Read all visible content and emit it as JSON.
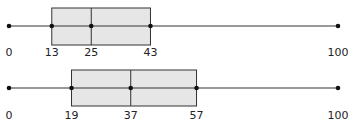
{
  "chart_data": [
    {
      "type": "boxplot",
      "title": "",
      "xlabel": "",
      "ylabel": "",
      "xlim": [
        0,
        100
      ],
      "grid": false,
      "min": 0,
      "q1": 13,
      "median": 25,
      "q3": 43,
      "max": 100,
      "tick_labels": [
        "0",
        "13",
        "25",
        "43",
        "100"
      ]
    },
    {
      "type": "boxplot",
      "title": "",
      "xlabel": "",
      "ylabel": "",
      "xlim": [
        0,
        100
      ],
      "grid": false,
      "min": 0,
      "q1": 19,
      "median": 37,
      "q3": 57,
      "max": 100,
      "tick_labels": [
        "0",
        "19",
        "37",
        "57",
        "100"
      ]
    }
  ],
  "style": {
    "box_fill": "#e6e6e6",
    "line_color": "#333333",
    "dot_color": "#111111"
  },
  "layout": {
    "x0_px": 9,
    "px_per_unit": 3.29,
    "plots": [
      {
        "line_y": 26,
        "box_top": 8,
        "box_bottom": 45,
        "label_y": 56
      },
      {
        "line_y": 88,
        "box_top": 70,
        "box_bottom": 106,
        "label_y": 119
      }
    ]
  }
}
